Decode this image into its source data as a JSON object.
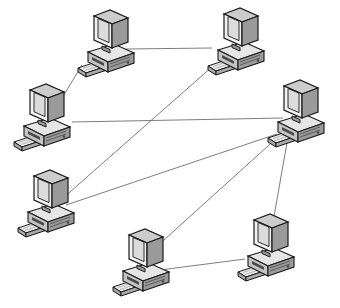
{
  "diagram": {
    "type": "network-topology",
    "background_color": "#ffffff",
    "width": 340,
    "height": 308,
    "node_count": 7,
    "link_count": 8,
    "node_icon_name": "desktop-computer-icon",
    "style": {
      "link_color": "#6e6e6e",
      "link_width": 0.9,
      "outline_color": "#1a1a1a",
      "monitor_face": "#f2f2f2",
      "monitor_screen": "#dcdcdc",
      "monitor_side": "#9a9a9a",
      "monitor_top": "#cccccc",
      "base_top": "#e6e6e6",
      "base_front": "#c4c4c4",
      "base_side": "#9a9a9a",
      "keyboard_top": "#ececec",
      "keyboard_side": "#a8a8a8",
      "shadow_color": "#4a4a4a"
    },
    "nodes": [
      {
        "id": "node-top-left",
        "label": "Computer 1",
        "name": "computer-node-top-left",
        "x": 108,
        "y": 42,
        "scale": 1.0
      },
      {
        "id": "node-top-right",
        "label": "Computer 2",
        "name": "computer-node-top-right",
        "x": 238,
        "y": 40,
        "scale": 1.0
      },
      {
        "id": "node-mid-left",
        "label": "Computer 3",
        "name": "computer-node-mid-left",
        "x": 44,
        "y": 116,
        "scale": 1.0
      },
      {
        "id": "node-mid-right",
        "label": "Computer 4",
        "name": "computer-node-mid-right-hub",
        "x": 298,
        "y": 112,
        "scale": 1.0
      },
      {
        "id": "node-lower-left",
        "label": "Computer 5",
        "name": "computer-node-lower-left",
        "x": 48,
        "y": 202,
        "scale": 1.0
      },
      {
        "id": "node-bottom-center",
        "label": "Computer 6",
        "name": "computer-node-bottom-center",
        "x": 143,
        "y": 261,
        "scale": 1.0
      },
      {
        "id": "node-bottom-right",
        "label": "Computer 7",
        "name": "computer-node-bottom-right",
        "x": 268,
        "y": 246,
        "scale": 1.0
      }
    ],
    "links": [
      {
        "id": "link-1",
        "name": "network-link-top-left-to-top-right",
        "from": "node-top-left",
        "to": "node-top-right",
        "x1": 126,
        "y1": 49,
        "x2": 212,
        "y2": 48
      },
      {
        "id": "link-2",
        "name": "network-link-top-left-to-mid-left",
        "from": "node-top-left",
        "to": "node-mid-left",
        "x1": 82,
        "y1": 65,
        "x2": 59,
        "y2": 103
      },
      {
        "id": "link-3",
        "name": "network-link-mid-left-to-mid-right-hub",
        "from": "node-mid-left",
        "to": "node-mid-right",
        "x1": 72,
        "y1": 122,
        "x2": 283,
        "y2": 118
      },
      {
        "id": "link-4",
        "name": "network-link-top-right-to-lower-left",
        "from": "node-top-right",
        "to": "node-lower-left",
        "x1": 213,
        "y1": 66,
        "x2": 62,
        "y2": 199
      },
      {
        "id": "link-5",
        "name": "network-link-lower-left-to-mid-right-hub",
        "from": "node-lower-left",
        "to": "node-mid-right",
        "x1": 66,
        "y1": 205,
        "x2": 277,
        "y2": 134
      },
      {
        "id": "link-6",
        "name": "network-link-mid-right-hub-to-bottom-center",
        "from": "node-mid-right",
        "to": "node-bottom-center",
        "x1": 279,
        "y1": 136,
        "x2": 154,
        "y2": 249
      },
      {
        "id": "link-7",
        "name": "network-link-mid-right-hub-to-bottom-right",
        "from": "node-mid-right",
        "to": "node-bottom-right",
        "x1": 288,
        "y1": 137,
        "x2": 273,
        "y2": 222
      },
      {
        "id": "link-8",
        "name": "network-link-bottom-center-to-bottom-right",
        "from": "node-bottom-center",
        "to": "node-bottom-right",
        "x1": 160,
        "y1": 270,
        "x2": 245,
        "y2": 259
      }
    ]
  }
}
